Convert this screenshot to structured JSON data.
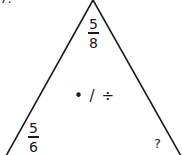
{
  "problem": {
    "number": "7."
  },
  "triangle": {
    "stroke_color": "#1a1a1a",
    "top": {
      "numerator": "5",
      "denominator": "8"
    },
    "bottom_left": {
      "numerator": "5",
      "denominator": "6"
    },
    "bottom_right": {
      "value": "?"
    },
    "operations": "• / ÷"
  }
}
